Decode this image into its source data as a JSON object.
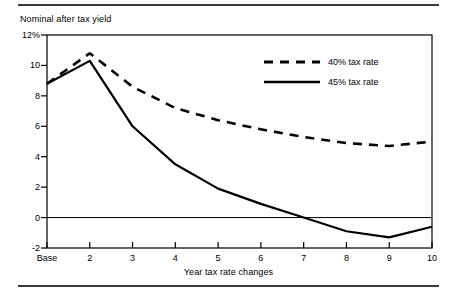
{
  "chart_data": {
    "type": "line",
    "title": "",
    "ylabel": "Nominal after tax yield",
    "xlabel": "Year tax rate changes",
    "categories": [
      "Base",
      "2",
      "3",
      "4",
      "5",
      "6",
      "7",
      "8",
      "9",
      "10"
    ],
    "x_tick_labels": [
      "Base",
      "2",
      "3",
      "4",
      "5",
      "6",
      "7",
      "8",
      "9",
      "10"
    ],
    "y_tick_labels": [
      "12%",
      "10",
      "8",
      "6",
      "4",
      "2",
      "0",
      "-2"
    ],
    "y_tick_values": [
      12,
      10,
      8,
      6,
      4,
      2,
      0,
      -2
    ],
    "ylim": [
      -2,
      12
    ],
    "grid": false,
    "zero_line": true,
    "legend_position": "upper-right",
    "series": [
      {
        "name": "40% tax rate",
        "style": "dashed",
        "color": "#000000",
        "values": [
          8.8,
          10.8,
          8.6,
          7.2,
          6.4,
          5.8,
          5.3,
          4.9,
          4.7,
          5.0
        ]
      },
      {
        "name": "45% tax rate",
        "style": "solid",
        "color": "#000000",
        "values": [
          8.8,
          10.3,
          6.0,
          3.5,
          1.9,
          0.9,
          0.0,
          -0.9,
          -1.3,
          -0.6
        ]
      }
    ]
  },
  "legend": {
    "items": [
      {
        "label": "40% tax rate",
        "style": "dashed"
      },
      {
        "label": "45% tax rate",
        "style": "solid"
      }
    ]
  },
  "axes": {
    "y_title": "Nominal after tax yield",
    "x_title": "Year tax rate changes"
  }
}
